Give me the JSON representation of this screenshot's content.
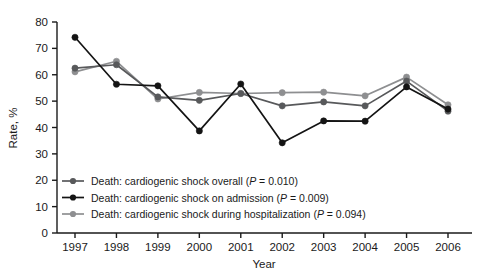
{
  "chart_data": {
    "type": "line",
    "title": "",
    "subtitle": "",
    "xlabel": "Year",
    "ylabel": "Rate, %",
    "x": [
      1997,
      1998,
      1999,
      2000,
      2001,
      2002,
      2003,
      2004,
      2005,
      2006
    ],
    "categories": [
      "1997",
      "1998",
      "1999",
      "2000",
      "2001",
      "2002",
      "2003",
      "2004",
      "2005",
      "2006"
    ],
    "xlim": [
      1996.6,
      2006.6
    ],
    "ylim": [
      0,
      80
    ],
    "yticks": [
      0,
      10,
      20,
      30,
      40,
      50,
      60,
      70,
      80
    ],
    "ytick_labels": [
      "0",
      "10",
      "20",
      "30",
      "40",
      "50",
      "60",
      "70",
      "80"
    ],
    "grid": false,
    "legend_position": "inside-lower-left",
    "series": [
      {
        "name": "Death: cardiogenic shock overall (P = 0.010)",
        "short_name": "Death: cardiogenic shock overall",
        "p_value": "P = 0.010",
        "color": "#58595b",
        "values": [
          62.5,
          63.8,
          51.6,
          50.3,
          52.9,
          48.2,
          49.7,
          48.2,
          57.6,
          46.2
        ]
      },
      {
        "name": "Death: cardiogenic shock on admission (P = 0.009)",
        "short_name": "Death: cardiogenic shock on admission",
        "p_value": "P = 0.009",
        "color": "#141414",
        "values": [
          74.2,
          56.4,
          55.8,
          38.7,
          56.5,
          34.2,
          42.5,
          42.4,
          55.4,
          47.0
        ]
      },
      {
        "name": "Death: cardiogenic shock during hospitalization (P = 0.094)",
        "short_name": "Death: cardiogenic shock during hospitalization",
        "p_value": "P = 0.094",
        "color": "#8e8f91",
        "values": [
          61.1,
          65.1,
          50.8,
          53.3,
          52.9,
          53.2,
          53.4,
          52.0,
          59.1,
          48.6
        ]
      }
    ]
  },
  "axes": {
    "y_label": "Rate, %",
    "x_label": "Year"
  },
  "legend": {
    "entries": [
      {
        "text_before": "Death: cardiogenic shock overall (",
        "p_italic": "P",
        "text_after": " = 0.010)",
        "full": "Death: cardiogenic shock overall (P = 0.010)",
        "marker": "line-dot-marker"
      },
      {
        "text_before": "Death: cardiogenic shock on admission (",
        "p_italic": "P",
        "text_after": " = 0.009)",
        "full": "Death: cardiogenic shock on admission (P = 0.009)",
        "marker": "line-dot-marker"
      },
      {
        "text_before": "Death: cardiogenic shock during hospitalization (",
        "p_italic": "P",
        "text_after": " = 0.094)",
        "full": "Death: cardiogenic shock during hospitalization (P = 0.094)",
        "marker": "line-dot-marker"
      }
    ]
  },
  "colors": {
    "series_overall": "#58595b",
    "series_admission": "#141414",
    "series_hospitalization": "#8e8f91",
    "axis": "#1a1a1a",
    "background": "#ffffff"
  }
}
